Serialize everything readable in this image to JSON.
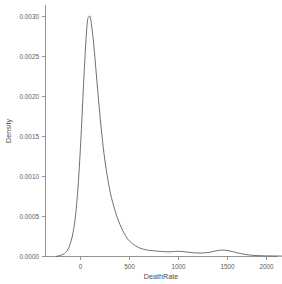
{
  "chart_data": {
    "type": "line",
    "title": "",
    "subtitle": "",
    "xlabel": "DeathRate",
    "ylabel": "Density",
    "xlim": [
      -420,
      2400
    ],
    "ylim": [
      0,
      0.00318
    ],
    "grid": false,
    "legend": null,
    "x_ticks": [
      0,
      500,
      1000,
      1500,
      2000
    ],
    "x_tick_labels": [
      "0",
      "500",
      "1000",
      "1500",
      "2000"
    ],
    "y_ticks": [
      0.0,
      0.0005,
      0.001,
      0.0015,
      0.002,
      0.0025,
      0.003
    ],
    "y_tick_labels": [
      "0.0000",
      "0.0005",
      "0.0010",
      "0.0015",
      "0.0020",
      "0.0025",
      "0.0030"
    ],
    "series": [
      {
        "name": "DeathRate density",
        "color": "#666666",
        "x": [
          -260,
          -230,
          -200,
          -170,
          -140,
          -110,
          -80,
          -50,
          -20,
          10,
          40,
          70,
          90,
          110,
          140,
          170,
          200,
          230,
          260,
          290,
          320,
          350,
          380,
          410,
          440,
          470,
          500,
          530,
          560,
          590,
          620,
          650,
          680,
          710,
          740,
          780,
          820,
          860,
          900,
          940,
          980,
          1020,
          1050,
          1090,
          1130,
          1170,
          1210,
          1250,
          1290,
          1330,
          1370,
          1410,
          1450,
          1490,
          1520,
          1560,
          1600,
          1640,
          1680,
          1720,
          1760,
          1800,
          1850,
          1900,
          1950,
          2000,
          2060,
          2120,
          2180,
          2240,
          2300
        ],
        "y": [
          0.0,
          1e-05,
          2e-05,
          4e-05,
          8e-05,
          0.00016,
          0.0003,
          0.00055,
          0.00098,
          0.0016,
          0.00232,
          0.00289,
          0.003,
          0.00296,
          0.00268,
          0.00228,
          0.00188,
          0.00152,
          0.00122,
          0.00099,
          0.0008,
          0.00066,
          0.00054,
          0.00044,
          0.00036,
          0.00029,
          0.00023,
          0.00019,
          0.00016,
          0.000135,
          0.000115,
          0.0001,
          9e-05,
          8.2e-05,
          7.7e-05,
          7.2e-05,
          6.8e-05,
          6.4e-05,
          6e-05,
          5.9e-05,
          6e-05,
          6.3e-05,
          6.5e-05,
          6.3e-05,
          5.8e-05,
          5.2e-05,
          4.7e-05,
          4.4e-05,
          4.3e-05,
          4.5e-05,
          5e-05,
          5.8e-05,
          6.8e-05,
          7.7e-05,
          8e-05,
          7.8e-05,
          7e-05,
          6e-05,
          4.8e-05,
          3.7e-05,
          2.8e-05,
          2.1e-05,
          1.5e-05,
          1.1e-05,
          9e-06,
          8e-06,
          7e-06,
          6e-06,
          5e-06,
          4e-06,
          3e-06
        ],
        "peak_x": 90,
        "peak_y": 0.003
      }
    ]
  },
  "figure": {
    "background_color": "#ffffff",
    "curve_color": "#666666",
    "axis_color": "#8a8a8a",
    "text_color": "#5a5a5a"
  }
}
